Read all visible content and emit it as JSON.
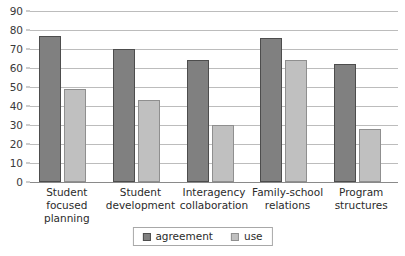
{
  "chart_data": {
    "type": "bar",
    "title": "",
    "subtitle": "",
    "xlabel": "",
    "ylabel": "",
    "categories": [
      "Student focused planning",
      "Student development",
      "Interagency collaboration",
      "Family-school relations",
      "Program structures"
    ],
    "series": [
      {
        "name": "agreement",
        "color": "#808080",
        "values": [
          77,
          70,
          64,
          76,
          62
        ]
      },
      {
        "name": "use",
        "color": "#c0c0c0",
        "values": [
          49,
          43,
          30,
          64,
          28
        ]
      }
    ],
    "ylim": [
      0,
      90
    ],
    "ytick_step": 10,
    "ytick_labels": [
      "0",
      "10",
      "20",
      "30",
      "40",
      "50",
      "60",
      "70",
      "80",
      "90"
    ],
    "grid": true,
    "grid_axis": "y",
    "legend_position": "bottom-center",
    "legend_entries": [
      "agreement",
      "use"
    ]
  },
  "legend": {
    "items": [
      {
        "label": "agreement",
        "swatch": "legend-swatch-agreement"
      },
      {
        "label": "use",
        "swatch": "legend-swatch-use"
      }
    ]
  },
  "colors": {
    "agreement": "#808080",
    "use": "#c0c0c0",
    "gridline": "#bcbcbc",
    "axis": "#8a8a8a",
    "text": "#2b2b2b",
    "background": "#ffffff"
  }
}
